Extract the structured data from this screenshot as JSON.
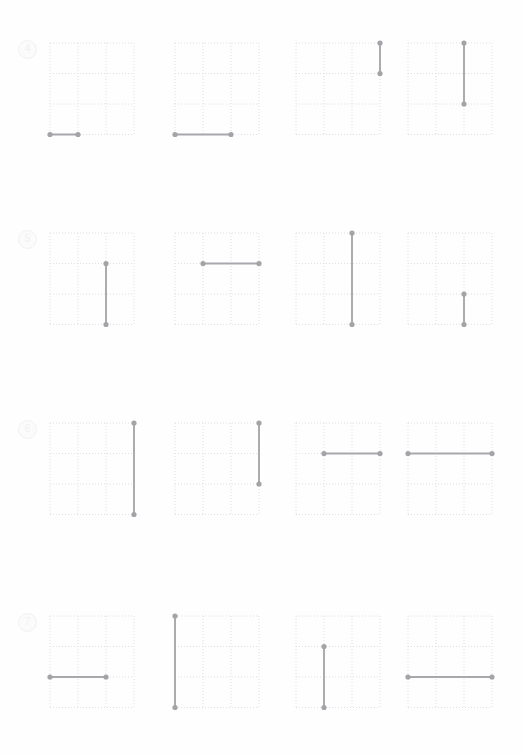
{
  "page": {
    "background_color": "#fefefe",
    "grid_line_color": "#dcdcdf",
    "segment_color": "#a8a8ac",
    "endpoint_color": "#a3a3a8",
    "label_color": "#f0f0f1"
  },
  "chart_data": {
    "type": "table",
    "title": "",
    "subtitle": "",
    "xlabel": "",
    "ylabel": "",
    "grid": {
      "columns": 3,
      "rows": 3,
      "dotted": true,
      "x_range": [
        0,
        3
      ],
      "y_range": [
        0,
        3
      ]
    },
    "exercises": [
      {
        "label": "4",
        "grids": [
          {
            "index": 1,
            "orientation": "horizontal",
            "length": 1,
            "x1": 0,
            "y1": 3,
            "x2": 1,
            "y2": 3
          },
          {
            "index": 2,
            "orientation": "horizontal",
            "length": 2,
            "x1": 0,
            "y1": 3,
            "x2": 2,
            "y2": 3
          },
          {
            "index": 3,
            "orientation": "vertical",
            "length": 1,
            "x1": 3,
            "y1": 0,
            "x2": 3,
            "y2": 1
          },
          {
            "index": 4,
            "orientation": "vertical",
            "length": 2,
            "x1": 2,
            "y1": 0,
            "x2": 2,
            "y2": 2
          }
        ]
      },
      {
        "label": "5",
        "grids": [
          {
            "index": 1,
            "orientation": "vertical",
            "length": 2,
            "x1": 2,
            "y1": 1,
            "x2": 2,
            "y2": 3
          },
          {
            "index": 2,
            "orientation": "horizontal",
            "length": 2,
            "x1": 1,
            "y1": 1,
            "x2": 3,
            "y2": 1
          },
          {
            "index": 3,
            "orientation": "vertical",
            "length": 3,
            "x1": 2,
            "y1": 0,
            "x2": 2,
            "y2": 3
          },
          {
            "index": 4,
            "orientation": "vertical",
            "length": 1,
            "x1": 2,
            "y1": 2,
            "x2": 2,
            "y2": 3
          }
        ]
      },
      {
        "label": "6",
        "grids": [
          {
            "index": 1,
            "orientation": "vertical",
            "length": 3,
            "x1": 3,
            "y1": 0,
            "x2": 3,
            "y2": 3
          },
          {
            "index": 2,
            "orientation": "vertical",
            "length": 2,
            "x1": 3,
            "y1": 0,
            "x2": 3,
            "y2": 2
          },
          {
            "index": 3,
            "orientation": "horizontal",
            "length": 2,
            "x1": 1,
            "y1": 1,
            "x2": 3,
            "y2": 1
          },
          {
            "index": 4,
            "orientation": "horizontal",
            "length": 3,
            "x1": 0,
            "y1": 1,
            "x2": 3,
            "y2": 1
          }
        ]
      },
      {
        "label": "7",
        "grids": [
          {
            "index": 1,
            "orientation": "horizontal",
            "length": 2,
            "x1": 0,
            "y1": 2,
            "x2": 2,
            "y2": 2
          },
          {
            "index": 2,
            "orientation": "vertical",
            "length": 3,
            "x1": 0,
            "y1": 0,
            "x2": 0,
            "y2": 3
          },
          {
            "index": 3,
            "orientation": "vertical",
            "length": 2,
            "x1": 1,
            "y1": 1,
            "x2": 1,
            "y2": 3
          },
          {
            "index": 4,
            "orientation": "horizontal",
            "length": 3,
            "x1": 0,
            "y1": 2,
            "x2": 3,
            "y2": 2
          }
        ]
      }
    ]
  }
}
